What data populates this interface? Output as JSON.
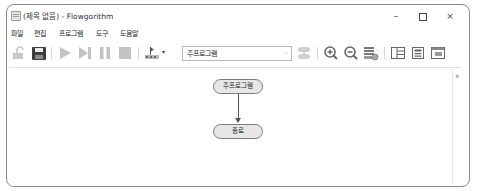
{
  "window": {
    "title": "(제목 없음) - Flowgorithm",
    "controls": {
      "minimize": "–",
      "maximize": "maximize",
      "close": "×"
    }
  },
  "menu": {
    "items": [
      {
        "label": "파일"
      },
      {
        "label": "편집"
      },
      {
        "label": "프로그램"
      },
      {
        "label": "도구"
      },
      {
        "label": "도움말"
      }
    ]
  },
  "toolbar": {
    "buttons": [
      {
        "name": "open-icon",
        "enabled": false
      },
      {
        "name": "save-icon",
        "enabled": true
      },
      {
        "name": "run-icon",
        "enabled": false
      },
      {
        "name": "step-icon",
        "enabled": false
      },
      {
        "name": "pause-icon",
        "enabled": false
      },
      {
        "name": "stop-icon",
        "enabled": false
      },
      {
        "name": "speed-icon",
        "enabled": true
      },
      {
        "name": "function-manager-icon",
        "enabled": false
      },
      {
        "name": "zoom-in-icon",
        "enabled": true
      },
      {
        "name": "zoom-out-icon",
        "enabled": true
      },
      {
        "name": "layout-icon",
        "enabled": true
      },
      {
        "name": "variable-watch-icon",
        "enabled": true
      },
      {
        "name": "console-icon",
        "enabled": true
      },
      {
        "name": "source-code-icon",
        "enabled": true
      }
    ],
    "function_select": {
      "value": "주프로그램"
    },
    "speed_dropdown_indicator": "▾"
  },
  "flowchart": {
    "nodes": [
      {
        "id": "main",
        "label": "주프로그램"
      },
      {
        "id": "end",
        "label": "종료"
      }
    ],
    "colors": {
      "node_fill": "#e6e6e6",
      "node_border": "#7d7d7d",
      "arrow": "#555555"
    }
  },
  "scrollbar": {
    "up_arrow": "▲"
  }
}
